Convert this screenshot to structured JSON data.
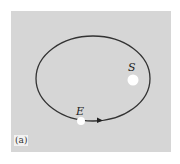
{
  "figure": {
    "panel_label": "(a)",
    "labels": {
      "sun": "S",
      "earth": "E"
    },
    "colors": {
      "background": "#d6d6d6",
      "orbit": "#333333",
      "bodies": "#ffffff"
    },
    "orbit": {
      "shape": "ellipse",
      "direction": "counterclockwise (arrow pointing right along bottom)"
    }
  }
}
